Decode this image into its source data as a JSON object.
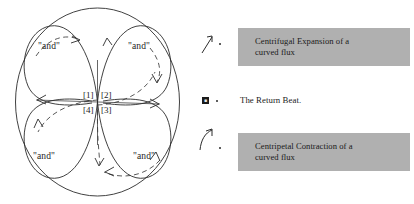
{
  "figure": {
    "diagram": {
      "outer_shape": "ellipse",
      "center_labels": [
        "[1]",
        "[2]",
        "[3]",
        "[4]"
      ],
      "quadrant_labels": [
        {
          "position": "top-left",
          "text": "\"and\""
        },
        {
          "position": "top-right",
          "text": "\"and\""
        },
        {
          "position": "bottom-left",
          "text": "\"and\""
        },
        {
          "position": "bottom-right",
          "text": "\"and\""
        }
      ],
      "petal_count": 4,
      "solid_stroke_color": "#2b2b2b",
      "dashed_stroke_color": "#3a3a3a"
    },
    "legend": {
      "items": [
        {
          "marker": "up-arrow-icon",
          "style": "gray-box",
          "line1": "Centrifugal Expansion of a",
          "line2": "curved flux",
          "background": "#b0b0b0"
        },
        {
          "marker": "filled-square-icon",
          "style": "plain",
          "line1": "The Return Beat.",
          "line2": "",
          "background": "#ffffff"
        },
        {
          "marker": "curved-up-arrow-icon",
          "style": "gray-box",
          "line1": "Centripetal Contraction of a",
          "line2": "curved flux",
          "background": "#b0b0b0"
        }
      ]
    }
  }
}
